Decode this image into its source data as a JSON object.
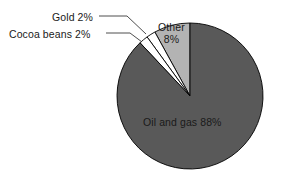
{
  "chart_data": {
    "type": "pie",
    "title": "",
    "subtitle": "",
    "xlabel": "",
    "ylabel": "",
    "legend_position": "none",
    "grid": false,
    "start_angle_deg": 90,
    "direction": "counterclockwise",
    "total_percent": 100,
    "categories": [
      "Other",
      "Gold",
      "Cocoa beans",
      "Oil and gas"
    ],
    "values": [
      8,
      2,
      2,
      88
    ],
    "slices": [
      {
        "name": "Other",
        "value": 8,
        "value_text": "8%",
        "label": "Other",
        "label_full": "Other 8%",
        "label_line1": "Other",
        "label_line2": "8%",
        "label_placement": "inside",
        "color": "#b3b3b3",
        "stroke": "#000000"
      },
      {
        "name": "Gold",
        "value": 2,
        "value_text": "2%",
        "label": "Gold",
        "label_full": "Gold 2%",
        "label_placement": "outside-leader",
        "color": "#ffffff",
        "stroke": "#000000"
      },
      {
        "name": "Cocoa beans",
        "value": 2,
        "value_text": "2%",
        "label": "Cocoa beans",
        "label_full": "Cocoa beans 2%",
        "label_placement": "outside-leader",
        "color": "#ffffff",
        "stroke": "#000000"
      },
      {
        "name": "Oil and gas",
        "value": 88,
        "value_text": "88%",
        "label": "Oil and gas",
        "label_full": "Oil and gas 88%",
        "label_placement": "inside",
        "color": "#595959",
        "stroke": "#000000"
      }
    ]
  },
  "labels": {
    "gold": "Gold 2%",
    "cocoa": "Cocoa beans 2%",
    "other_line1": "Other",
    "other_line2": "8%",
    "oil_and_gas": "Oil and gas 88%"
  },
  "colors": {
    "background": "#ffffff",
    "text": "#1a1a1a",
    "oil_and_gas": "#595959",
    "other": "#b3b3b3",
    "gold": "#ffffff",
    "cocoa_beans": "#ffffff",
    "outline": "#000000",
    "leader_line": "#3a3a3a"
  },
  "geometry": {
    "center_x": 190,
    "center_y": 96,
    "radius": 73
  }
}
